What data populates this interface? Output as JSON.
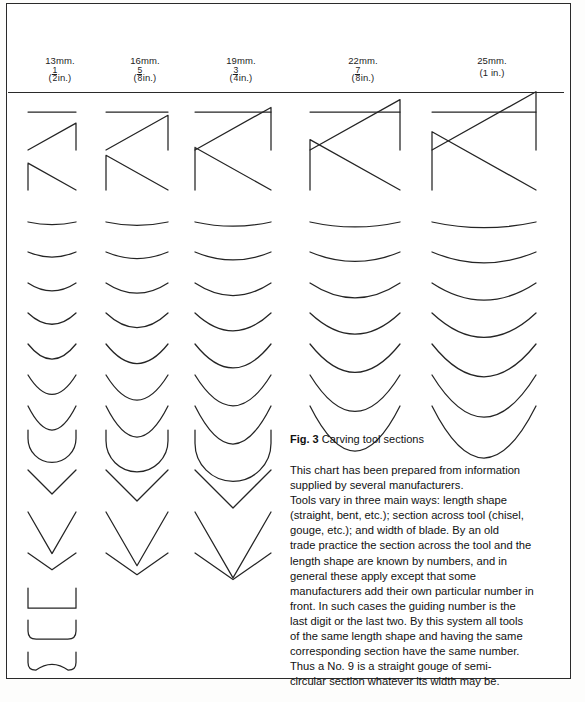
{
  "figure": {
    "caption_label": "Fig. 3",
    "caption_text": "Carving tool sections",
    "body_lines": [
      "This chart has been prepared from information",
      "supplied by several manufacturers.",
      "Tools vary in three main ways: length shape",
      "(straight, bent, etc.); section across tool (chisel,",
      "gouge, etc.); and width of blade. By an old",
      "trade practice the section across the tool and the",
      "length shape are known by numbers, and in",
      "general these apply except that some",
      "manufacturers add their own particular number in",
      "front. In such cases the guiding number is the",
      "last digit or the last two. By this system all tools",
      "of the same length shape and having the same",
      "corresponding section have the same number.",
      "Thus a No. 9 is a straight gouge of semi-",
      "circular section whatever its width may be."
    ]
  },
  "columns": [
    {
      "mm": "13mm.",
      "inch_num": "1",
      "inch_den": "2",
      "inch_suffix": "in.)",
      "inch_prefix": "("
    },
    {
      "mm": "16mm.",
      "inch_num": "5",
      "inch_den": "8",
      "inch_suffix": "in.)",
      "inch_prefix": "("
    },
    {
      "mm": "19mm.",
      "inch_num": "3",
      "inch_den": "4",
      "inch_suffix": "in.)",
      "inch_prefix": "("
    },
    {
      "mm": "22mm.",
      "inch_num": "7",
      "inch_den": "8",
      "inch_suffix": "in.)",
      "inch_prefix": "("
    },
    {
      "mm": "25mm.",
      "inch_num": "",
      "inch_den": "",
      "inch_suffix": "(1 in.)",
      "inch_prefix": ""
    }
  ],
  "chart_data": {
    "type": "table",
    "title": "Carving tool sections",
    "xlabel": "Width of blade",
    "ylabel": "Section across tool",
    "grid": false,
    "legend": "none",
    "column_widths_mm": [
      13,
      16,
      19,
      22,
      25
    ],
    "column_widths_in": [
      "1/2",
      "5/8",
      "3/4",
      "7/8",
      "1"
    ],
    "column_centers_px": [
      52,
      137,
      233,
      355,
      484
    ],
    "column_blade_px": [
      48,
      62,
      76,
      90,
      104
    ],
    "row_kinds": [
      {
        "kind": "flat-chisel",
        "y": 112,
        "depth": 0.0,
        "columns": [
          1,
          2,
          3,
          4,
          5
        ]
      },
      {
        "kind": "skew-chisel-left",
        "y": 150,
        "depth": 0.0,
        "columns": [
          1,
          2,
          3,
          4,
          5
        ]
      },
      {
        "kind": "skew-chisel-right",
        "y": 190,
        "depth": 0.0,
        "columns": [
          1,
          2,
          3,
          4,
          5
        ]
      },
      {
        "kind": "gouge",
        "y": 222,
        "depth": 0.055,
        "columns": [
          1,
          2,
          3,
          4,
          5
        ]
      },
      {
        "kind": "gouge",
        "y": 252,
        "depth": 0.105,
        "columns": [
          1,
          2,
          3,
          4,
          5
        ]
      },
      {
        "kind": "gouge",
        "y": 283,
        "depth": 0.165,
        "columns": [
          1,
          2,
          3,
          4,
          5
        ]
      },
      {
        "kind": "gouge",
        "y": 313,
        "depth": 0.235,
        "columns": [
          1,
          2,
          3,
          4,
          5
        ]
      },
      {
        "kind": "gouge",
        "y": 344,
        "depth": 0.315,
        "columns": [
          1,
          2,
          3,
          4,
          5
        ]
      },
      {
        "kind": "gouge",
        "y": 375,
        "depth": 0.405,
        "columns": [
          1,
          2,
          3,
          4,
          5
        ]
      },
      {
        "kind": "gouge",
        "y": 406,
        "depth": 0.5,
        "columns": [
          1,
          2,
          3,
          4,
          5
        ]
      },
      {
        "kind": "gouge-deep",
        "y": 430,
        "depth": 0.64,
        "columns": [
          1,
          2,
          3
        ]
      },
      {
        "kind": "v-tool",
        "y": 470,
        "angle": 90,
        "columns": [
          1,
          2,
          3
        ]
      },
      {
        "kind": "v-tool",
        "y": 512,
        "angle": 60,
        "columns": [
          1,
          2,
          3
        ]
      },
      {
        "kind": "v-tool",
        "y": 553,
        "angle": 110,
        "columns": [
          1,
          2,
          3
        ]
      },
      {
        "kind": "macaroni-square",
        "y": 588,
        "columns": [
          1
        ]
      },
      {
        "kind": "macaroni-rounded",
        "y": 620,
        "columns": [
          1
        ]
      },
      {
        "kind": "fluteroni",
        "y": 652,
        "columns": [
          1
        ]
      }
    ],
    "stroke_color": "#222222",
    "background": "#ffffff"
  },
  "colors": {
    "ink": "#1d1d1d",
    "stroke": "#242424",
    "frame": "#2a2a2a",
    "paper": "#ffffff"
  }
}
